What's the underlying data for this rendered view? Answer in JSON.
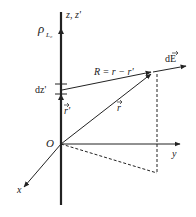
{
  "diagram": {
    "labels": {
      "z_axis": "z, z'",
      "charge_density": "ρ",
      "charge_density_sub": "L₀",
      "dz": "dz'",
      "R_eq": "R = r − r'",
      "dE": "dE",
      "r_prime": "r'",
      "r": "r",
      "origin": "O",
      "x_axis": "x",
      "y_axis": "y"
    },
    "colors": {
      "line": "#222222",
      "background": "#ffffff"
    }
  }
}
